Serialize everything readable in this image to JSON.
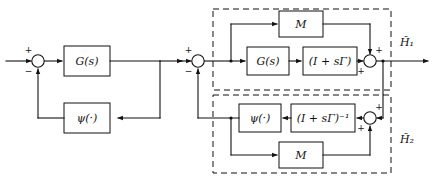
{
  "figure": {
    "kind": "control-block-diagram",
    "ink_color": "#111111",
    "background_color": "#ffffff",
    "width": 433,
    "height": 181
  },
  "left_diagram": {
    "name": "standard-feedback-loop",
    "blocks": [
      {
        "id": "g",
        "label": "G(s)"
      },
      {
        "id": "psi",
        "label": "ψ(·)"
      }
    ],
    "summing_junction": {
      "id": "sum-left",
      "sign_top": "+",
      "sign_bottom": "−"
    }
  },
  "right_diagram": {
    "name": "loop-transformed-feedback-loop",
    "summing_junction_input": {
      "id": "sum-right-input",
      "sign_top": "+",
      "sign_bottom": "−"
    },
    "upper_group": {
      "id": "h1",
      "label": "H̃₁",
      "label_base": "H",
      "label_sub": "1",
      "blocks": [
        {
          "id": "m-top",
          "label": "M"
        },
        {
          "id": "g",
          "label": "G(s)"
        },
        {
          "id": "i-plus-sgamma",
          "label": "(I + sΓ)"
        }
      ],
      "summing_junction": {
        "id": "sum-h1",
        "sign_top": "+",
        "sign_bottom": "+"
      }
    },
    "lower_group": {
      "id": "h2",
      "label": "H̃₂",
      "label_base": "H",
      "label_sub": "2",
      "blocks": [
        {
          "id": "psi",
          "label": "ψ(·)"
        },
        {
          "id": "i-plus-sgamma-inv",
          "label": "(I + sΓ)⁻¹"
        },
        {
          "id": "m-bottom",
          "label": "M"
        }
      ],
      "summing_junction": {
        "id": "sum-h2",
        "sign_top": "+",
        "sign_bottom": "+"
      }
    }
  }
}
